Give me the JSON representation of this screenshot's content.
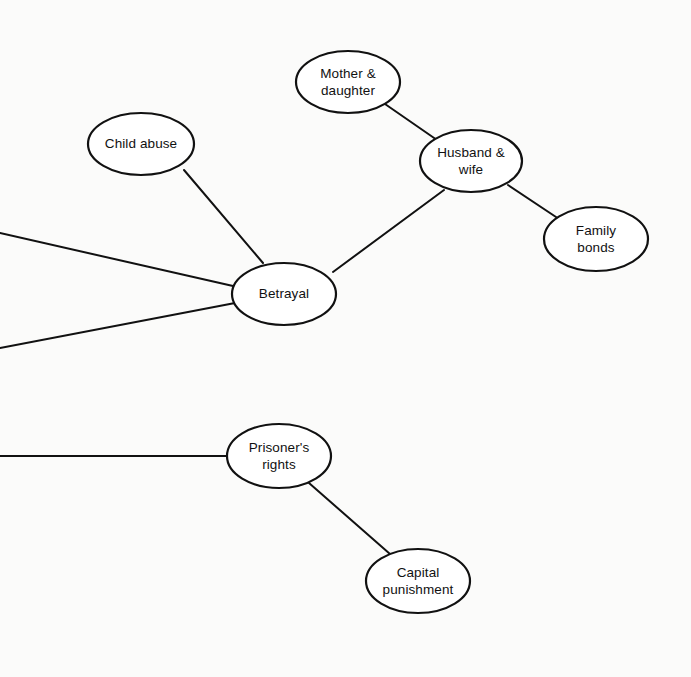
{
  "diagram": {
    "type": "concept-map",
    "background_color": "#fbfbfa",
    "line_color": "#111111",
    "node_fill": "#ffffff",
    "nodes": [
      {
        "id": "mother-daughter",
        "label": "Mother &\ndaughter",
        "cx": 348,
        "cy": 82,
        "rx": 52,
        "ry": 31
      },
      {
        "id": "child-abuse",
        "label": "Child abuse",
        "cx": 141,
        "cy": 144,
        "rx": 53,
        "ry": 31
      },
      {
        "id": "husband-wife",
        "label": "Husband &\nwife",
        "cx": 471,
        "cy": 161,
        "rx": 51,
        "ry": 31
      },
      {
        "id": "family-bonds",
        "label": "Family\nbonds",
        "cx": 596,
        "cy": 239,
        "rx": 52,
        "ry": 32
      },
      {
        "id": "betrayal",
        "label": "Betrayal",
        "cx": 284,
        "cy": 294,
        "rx": 52,
        "ry": 31
      },
      {
        "id": "prisoners-rights",
        "label": "Prisoner's\nrights",
        "cx": 279,
        "cy": 456,
        "rx": 52,
        "ry": 32
      },
      {
        "id": "capital-punishment",
        "label": "Capital\npunishment",
        "cx": 418,
        "cy": 581,
        "rx": 52,
        "ry": 32
      }
    ],
    "edges": [
      {
        "id": "edge-mother-daughter-husband-wife",
        "from": "mother-daughter",
        "to": "husband-wife",
        "x1": 385,
        "y1": 104,
        "x2": 437,
        "y2": 140
      },
      {
        "id": "edge-husband-wife-family-bonds",
        "from": "husband-wife",
        "to": "family-bonds",
        "x1": 508,
        "y1": 185,
        "x2": 559,
        "y2": 219
      },
      {
        "id": "edge-betrayal-husband-wife",
        "from": "betrayal",
        "to": "husband-wife",
        "x1": 333,
        "y1": 272,
        "x2": 444,
        "y2": 190
      },
      {
        "id": "edge-child-abuse-betrayal",
        "from": "child-abuse",
        "to": "betrayal",
        "x1": 184,
        "y1": 170,
        "x2": 263,
        "y2": 263
      },
      {
        "id": "edge-betrayal-offscreen-upper",
        "from": "betrayal",
        "to": "offscreen-left-upper",
        "x1": 233,
        "y1": 286,
        "x2": 0,
        "y2": 233
      },
      {
        "id": "edge-betrayal-offscreen-lower",
        "from": "betrayal",
        "to": "offscreen-left-lower",
        "x1": 235,
        "y1": 303,
        "x2": 0,
        "y2": 348
      },
      {
        "id": "edge-prisoners-rights-offscreen",
        "from": "prisoners-rights",
        "to": "offscreen-left",
        "x1": 227,
        "y1": 456,
        "x2": 0,
        "y2": 456
      },
      {
        "id": "edge-prisoners-rights-capital-punishment",
        "from": "prisoners-rights",
        "to": "capital-punishment",
        "x1": 309,
        "y1": 483,
        "x2": 390,
        "y2": 554
      }
    ]
  }
}
